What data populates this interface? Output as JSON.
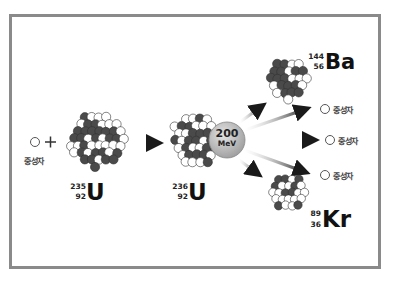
{
  "diagram": {
    "reactant_neutron_label": "중성자",
    "plus_sign": "+",
    "uranium235": {
      "mass": "235",
      "atomic_number": "92",
      "symbol": "U"
    },
    "uranium236": {
      "mass": "236",
      "atomic_number": "92",
      "symbol": "U"
    },
    "energy": {
      "value": "200",
      "unit": "MeV"
    },
    "barium": {
      "mass": "144",
      "atomic_number": "56",
      "symbol": "Ba"
    },
    "krypton": {
      "mass": "89",
      "atomic_number": "36",
      "symbol": "Kr"
    },
    "product_neutrons": [
      {
        "label": "중성자"
      },
      {
        "label": "중성자"
      },
      {
        "label": "중성자"
      }
    ],
    "colors": {
      "frame_border": "#8a8a8a",
      "proton": "#4a4a4a",
      "neutron": "#ffffff",
      "energy_bubble": "#b8b8b8",
      "arrow": "#222222"
    }
  }
}
